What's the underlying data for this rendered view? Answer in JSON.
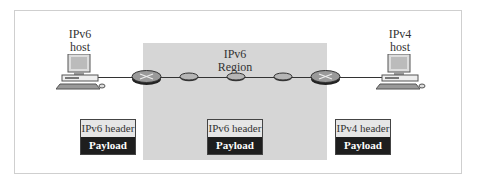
{
  "diagram": {
    "left_host": {
      "line1": "IPv6",
      "line2": "host"
    },
    "right_host": {
      "line1": "IPv4",
      "line2": "host"
    },
    "region": {
      "line1": "IPv6",
      "line2": "Region"
    },
    "packets": [
      {
        "header": "IPv6 header",
        "payload": "Payload"
      },
      {
        "header": "IPv6 header",
        "payload": "Payload"
      },
      {
        "header": "IPv4 header",
        "payload": "Payload"
      }
    ],
    "colors": {
      "region_fill": "#d6d6d6",
      "payload_fill": "#1e1e1e",
      "header_fill": "#e6e6e6",
      "frame_border": "#cfcfcf"
    }
  }
}
